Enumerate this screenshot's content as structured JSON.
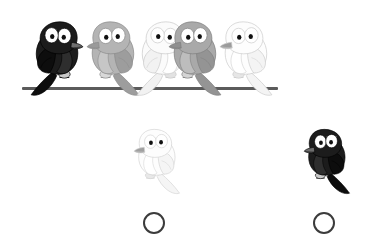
{
  "page": {
    "title": "Bird Pattern Question",
    "background_color": "#ffffff",
    "width": 380,
    "height": 244
  },
  "watermark": {
    "visible": true,
    "text": "",
    "color": "#fcfcfc"
  },
  "wire": {
    "label": "wire",
    "color": "#5b5b5b",
    "x": 22,
    "y": 87,
    "width": 256,
    "height": 3
  },
  "prompt_row": {
    "label": "birds-on-a-wire",
    "count": 5,
    "birds": [
      {
        "index": 1,
        "color_name": "black",
        "body_color": "#1c1c1c",
        "wing_color": "#0d0d0d",
        "belly_color": "#2e2e2e",
        "outline_color": "#000000",
        "beak_color": "#6e6e6e",
        "foot_color": "#c9c9c9",
        "facing": "right",
        "x": 26,
        "y": 18,
        "width": 64,
        "height": 80
      },
      {
        "index": 2,
        "color_name": "gray",
        "body_color": "#b4b4b4",
        "wing_color": "#9d9d9d",
        "belly_color": "#c6c6c6",
        "outline_color": "#8a8a8a",
        "beak_color": "#9a9a9a",
        "foot_color": "#d8d8d8",
        "facing": "left",
        "x": 80,
        "y": 18,
        "width": 64,
        "height": 80
      },
      {
        "index": 3,
        "color_name": "white",
        "body_color": "#fbfbfb",
        "wing_color": "#f2f2f2",
        "belly_color": "#ffffff",
        "outline_color": "#c9c9c9",
        "beak_color": "#6a6a6a",
        "foot_color": "#e2e2e2",
        "facing": "right",
        "x": 132,
        "y": 18,
        "width": 64,
        "height": 80
      },
      {
        "index": 4,
        "color_name": "gray",
        "body_color": "#a9a9a9",
        "wing_color": "#949494",
        "belly_color": "#bdbdbd",
        "outline_color": "#7f7f7f",
        "beak_color": "#8f8f8f",
        "foot_color": "#d4d4d4",
        "facing": "left",
        "x": 162,
        "y": 18,
        "width": 64,
        "height": 80
      },
      {
        "index": 5,
        "color_name": "white",
        "body_color": "#fdfdfd",
        "wing_color": "#f4f4f4",
        "belly_color": "#ffffff",
        "outline_color": "#cccccc",
        "beak_color": "#9b9b9b",
        "foot_color": "#e6e6e6",
        "facing": "left",
        "x": 213,
        "y": 18,
        "width": 64,
        "height": 80
      }
    ]
  },
  "answer_options": {
    "label": "answer-options",
    "count": 2,
    "options": [
      {
        "index": 1,
        "option_label": "A",
        "color_name": "white",
        "body_color": "#fdfdfd",
        "wing_color": "#f5f5f5",
        "belly_color": "#ffffff",
        "outline_color": "#cfcfcf",
        "beak_color": "#a0a0a0",
        "foot_color": "#e8e8e8",
        "facing": "left",
        "selected": false,
        "bird": {
          "x": 128,
          "y": 126,
          "width": 56,
          "height": 70
        },
        "circle": {
          "x": 143,
          "y": 212,
          "diameter": 22,
          "border_color": "#3b3b3b",
          "border_width": 2
        }
      },
      {
        "index": 2,
        "option_label": "B",
        "color_name": "black",
        "body_color": "#1c1c1c",
        "wing_color": "#0d0d0d",
        "belly_color": "#2e2e2e",
        "outline_color": "#000000",
        "beak_color": "#6e6e6e",
        "foot_color": "#c9c9c9",
        "facing": "left",
        "selected": false,
        "bird": {
          "x": 298,
          "y": 126,
          "width": 56,
          "height": 70
        },
        "circle": {
          "x": 313,
          "y": 212,
          "diameter": 22,
          "border_color": "#3b3b3b",
          "border_width": 2
        }
      }
    ]
  }
}
